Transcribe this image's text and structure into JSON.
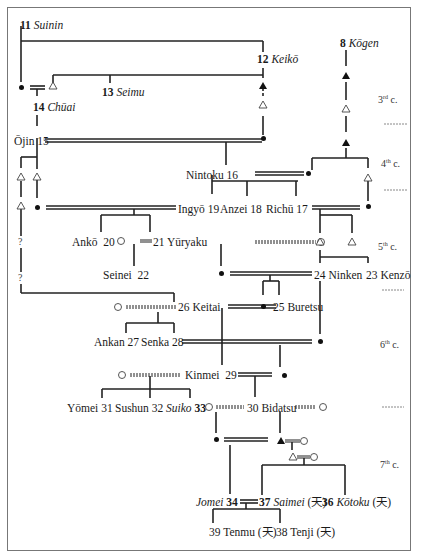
{
  "diagram": {
    "centuries": [
      {
        "id": "c3",
        "num": "3",
        "suffix": "rd",
        "label": "c."
      },
      {
        "id": "c4",
        "num": "4",
        "suffix": "th",
        "label": "c."
      },
      {
        "id": "c5",
        "num": "5",
        "suffix": "th",
        "label": "c."
      },
      {
        "id": "c6",
        "num": "6",
        "suffix": "th",
        "label": "c."
      },
      {
        "id": "c7",
        "num": "7",
        "suffix": "th",
        "label": "c."
      }
    ],
    "emperors": {
      "suinin": {
        "num": "11",
        "name": "Suinin",
        "female": false,
        "italic": true
      },
      "keiko": {
        "num": "12",
        "name": "Keikō",
        "italic": true
      },
      "kogen": {
        "num": "8",
        "name": "Kōgen",
        "italic": true
      },
      "seimu": {
        "num": "13",
        "name": "Seimu",
        "italic": true
      },
      "chuai": {
        "num": "14",
        "name": "Chūai",
        "italic": true
      },
      "ojin": {
        "name": "Ōjin",
        "num": "15"
      },
      "nintoku": {
        "name": "Nintoku",
        "num": "16"
      },
      "ingyo": {
        "name": "Ingyō",
        "num": "19"
      },
      "anzei": {
        "name": "Anzei",
        "num": "18"
      },
      "richu": {
        "name": "Richū",
        "num": "17"
      },
      "anko": {
        "name": "Ankō",
        "num": "20"
      },
      "yuryaku": {
        "num": "21",
        "name": "Yūryaku"
      },
      "seinei": {
        "name": "Seinei",
        "num": "22"
      },
      "ninken": {
        "num": "24",
        "name": "Ninken"
      },
      "kenzo": {
        "num": "23",
        "name": "Kenzō"
      },
      "keitai": {
        "num": "26",
        "name": "Keitai"
      },
      "buretsu": {
        "num": "25",
        "name": "Buretsu"
      },
      "ankan": {
        "name": "Ankan",
        "num": "27"
      },
      "senka": {
        "name": "Senka",
        "num": "28"
      },
      "kinmei": {
        "name": "Kinmei",
        "num": "29"
      },
      "yomei": {
        "name": "Yōmei",
        "num": "31"
      },
      "sushun": {
        "name": "Sushun",
        "num": "32"
      },
      "suiko": {
        "name": "Suiko",
        "num": "33"
      },
      "bidatsu": {
        "num": "30",
        "name": "Bidatsu"
      },
      "jomei": {
        "name": "Jomei",
        "num": "34"
      },
      "saimei": {
        "num": "37",
        "name": "Saimei",
        "note": "(天)"
      },
      "kotoku": {
        "num": "36",
        "name": "Kōtoku",
        "note": "(天)"
      },
      "tenmu": {
        "num": "39",
        "name": "Tenmu",
        "note": "(天)"
      },
      "tenji": {
        "num": "38",
        "name": "Tenji",
        "note": "(天)"
      }
    },
    "unknown_marker": "?",
    "legend_symbols": {
      "filled_dot": "female (non-ruler)",
      "open_circle": "female",
      "open_triangle": "male",
      "filled_triangle": "male"
    }
  }
}
